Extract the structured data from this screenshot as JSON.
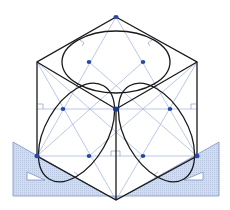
{
  "diagram": {
    "colors": {
      "background": "#ffffff",
      "outline": "#1a1a1a",
      "construction": "#8fa6d6",
      "points": "#2748a8",
      "set_square_fill": "#cfd8ea",
      "set_square_edge": "#7f93c2"
    },
    "cube": {
      "top": [
        116,
        17
      ],
      "upper_left": [
        37,
        62
      ],
      "upper_right": [
        197,
        62
      ],
      "center": [
        116,
        109
      ],
      "lower_left": [
        37,
        156
      ],
      "lower_right": [
        197,
        156
      ],
      "bottom": [
        116,
        200
      ]
    },
    "points": [
      [
        116,
        17
      ],
      [
        89,
        62
      ],
      [
        143,
        62
      ],
      [
        63,
        109
      ],
      [
        116,
        109
      ],
      [
        170,
        109
      ],
      [
        37,
        156
      ],
      [
        89,
        156
      ],
      [
        143,
        156
      ],
      [
        197,
        156
      ]
    ],
    "set_squares": [
      {
        "side": "left",
        "label": "left-set-square"
      },
      {
        "side": "right",
        "label": "right-set-square"
      }
    ]
  }
}
